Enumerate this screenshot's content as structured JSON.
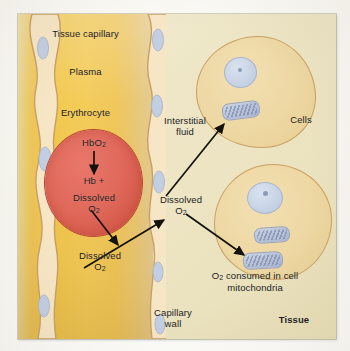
{
  "figure": {
    "title_label": "Tissue capillary",
    "corner_label": "Tissue"
  },
  "labels": {
    "tissue_capillary": "Tissue capillary",
    "plasma": "Plasma",
    "erythrocyte": "Erythrocyte",
    "hbo2": "HbO",
    "hbo2_sub": "2",
    "hb_plus": "Hb +",
    "dissolved_rbc": "Dissolved",
    "o2_rbc": "O",
    "o2_rbc_sub": "2",
    "dissolved_plasma": "Dissolved",
    "o2_plasma": "O",
    "o2_plasma_sub": "2",
    "interstitial_fluid_line1": "Interstitial",
    "interstitial_fluid_line2": "fluid",
    "dissolved_interstitial": "Dissolved",
    "o2_interstitial": "O",
    "o2_interstitial_sub": "2",
    "cells": "Cells",
    "consumed_line1_pre": "O",
    "consumed_line1_sub": "2",
    "consumed_line1_post": " consumed in cell",
    "consumed_line2": "mitochondria",
    "capillary_wall_line1": "Capillary",
    "capillary_wall_line2": "wall",
    "tissue": "Tissue"
  },
  "colors": {
    "plate_background": "#ece4c4",
    "plasma": "#f2c84f",
    "erythrocyte": "#de6a5c",
    "erythrocyte_border": "#b8443a",
    "capillary_wall": "#f6e6c6",
    "capillary_wall_border": "#c9a063",
    "cell_cytoplasm": "#eed8a4",
    "cell_border": "#c9a063",
    "nucleus": "#c9d4e6",
    "mitochondria": "#b9c4dc",
    "arrow": "#14120f",
    "text": "#1a1a18"
  },
  "diagram": {
    "type": "biological-schematic",
    "compartments": [
      "Tissue capillary",
      "Plasma",
      "Capillary wall",
      "Interstitial fluid",
      "Tissue"
    ],
    "structures": [
      {
        "name": "erythrocyte",
        "count": 1,
        "contents": [
          "HbO2",
          "Hb +",
          "Dissolved O2"
        ]
      },
      {
        "name": "tissue-cell",
        "count": 2,
        "organelles": [
          "nucleus",
          "mitochondria"
        ]
      }
    ],
    "flow_steps": [
      "HbO2 dissociates to Hb + Dissolved O2 inside erythrocyte",
      "Dissolved O2 leaves erythrocyte into plasma",
      "Dissolved O2 crosses capillary wall into interstitial fluid",
      "Dissolved O2 enters cell and is consumed in cell mitochondria"
    ],
    "arrows": [
      {
        "from": "HbO2",
        "to": "Hb + Dissolved O2",
        "style": "straight-down"
      },
      {
        "from": "Dissolved O2 (erythrocyte)",
        "to": "Dissolved O2 (plasma)",
        "style": "diagonal"
      },
      {
        "from": "Dissolved O2 (plasma)",
        "to": "Dissolved O2 (interstitial fluid)",
        "style": "diagonal"
      },
      {
        "from": "Dissolved O2 (interstitial fluid)",
        "to": "mitochondrion (upper cell)",
        "style": "diagonal"
      },
      {
        "from": "Dissolved O2 (interstitial fluid)",
        "to": "mitochondrion (lower cell)",
        "style": "diagonal"
      }
    ]
  }
}
